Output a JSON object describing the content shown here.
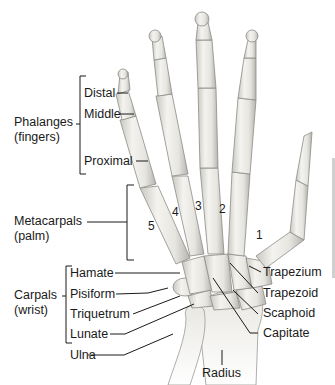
{
  "diagram": {
    "groups": [
      {
        "id": "phalanges",
        "line1": "Phalanges",
        "line2": "(fingers)",
        "members": [
          "Distal",
          "Middle",
          "Proximal"
        ]
      },
      {
        "id": "metacarpals",
        "line1": "Metacarpals",
        "line2": "(palm)"
      },
      {
        "id": "carpals",
        "line1": "Carpals",
        "line2": "(wrist)",
        "members": [
          "Hamate",
          "Pisiform",
          "Triquetrum",
          "Lunate"
        ]
      }
    ],
    "left_labels": {
      "distal": "Distal",
      "middle": "Middle",
      "proximal": "Proximal",
      "hamate": "Hamate",
      "pisiform": "Pisiform",
      "triquetrum": "Triquetrum",
      "lunate": "Lunate",
      "ulna": "Ulna"
    },
    "right_labels": {
      "trapezium": "Trapezium",
      "trapezoid": "Trapezoid",
      "scaphoid": "Scaphoid",
      "capitate": "Capitate"
    },
    "bottom_labels": {
      "radius": "Radius"
    },
    "metacarpal_numbers": [
      "1",
      "2",
      "3",
      "4",
      "5"
    ],
    "colors": {
      "bone": "#ecebe6",
      "bone_shade": "#b9b8b2",
      "bone_outline": "#8c8b86",
      "leader_line": "#1a1a1a",
      "background": "#ffffff"
    }
  }
}
